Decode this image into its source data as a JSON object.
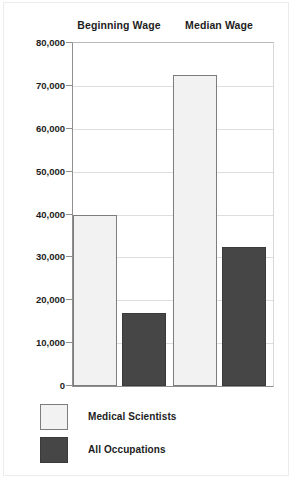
{
  "chart_data": {
    "type": "bar",
    "title": "",
    "xlabel": "",
    "ylabel": "",
    "ylim": [
      0,
      80000
    ],
    "grid": true,
    "legend_position": "bottom-left",
    "categories": [
      "Beginning Wage",
      "Median Wage"
    ],
    "ytick_labels": [
      "80,000",
      "70,000",
      "60,000",
      "50,000",
      "40,000",
      "30,000",
      "20,000",
      "10,000",
      "0"
    ],
    "ytick_values": [
      80000,
      70000,
      60000,
      50000,
      40000,
      30000,
      20000,
      10000,
      0
    ],
    "series": [
      {
        "name": "Medical Scientists",
        "color": "#f2f2f2",
        "values": [
          40000,
          72500
        ]
      },
      {
        "name": "All Occupations",
        "color": "#464646",
        "values": [
          17000,
          32500
        ]
      }
    ]
  },
  "colors": {
    "light_bar": "#f2f2f2",
    "dark_bar": "#464646",
    "axis": "#8f8f8f",
    "grid": "#dedede",
    "text": "#1d1d1d"
  }
}
